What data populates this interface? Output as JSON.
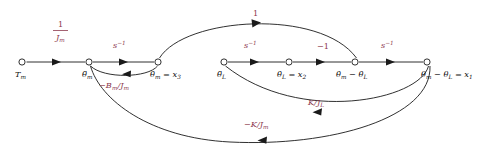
{
  "figure": {
    "kind": "signal-flow-graph",
    "background_color": "#ffffff",
    "edge_color": "#1a1a1a",
    "node_label_color": "#111111",
    "gain_label_color": "#8d3a4e"
  },
  "nodes": [
    {
      "id": "Tm",
      "label": "T",
      "sub": "m",
      "x": 22,
      "y": 62
    },
    {
      "id": "thm_ddot",
      "label": "θ̈",
      "sub": "m",
      "x": 89,
      "y": 62
    },
    {
      "id": "thm_dot",
      "label": "θ̇",
      "sub": "m",
      "x": 158,
      "y": 62
    },
    {
      "id": "thL_ddot",
      "label": "θ̈",
      "sub": "L",
      "x": 224,
      "y": 62
    },
    {
      "id": "thL_dot",
      "label": "θ̇",
      "sub": "L",
      "x": 289,
      "y": 62
    },
    {
      "id": "diff_dot",
      "label": "θ̇",
      "sub": "m",
      "x": 355,
      "y": 62
    },
    {
      "id": "diff",
      "label": "θ",
      "sub": "m",
      "x": 427,
      "y": 62
    }
  ],
  "node_labels": {
    "Tm": {
      "base": "T",
      "sub": "m",
      "tail": ""
    },
    "thm_ddot": {
      "base": "θ̈",
      "sub": "m",
      "tail": ""
    },
    "thm_dot": {
      "base": "θ̇",
      "sub": "m",
      "tail": " = x",
      "tail_sub": "3"
    },
    "thL_ddot": {
      "base": "θ̈",
      "sub": "L",
      "tail": ""
    },
    "thL_dot": {
      "base": "θ̇",
      "sub": "L",
      "tail": " = x",
      "tail_sub": "2"
    },
    "diff_dot": {
      "base": "θ̇",
      "sub": "m",
      "tail": " − θ̇",
      "tail_sub": "L"
    },
    "diff": {
      "base": "θ",
      "sub": "m",
      "tail": " − θ",
      "tail_sub": "L",
      "tail2": " = x",
      "tail2_sub": "1"
    }
  },
  "gains": {
    "one_over_Jm": {
      "numerator": "1",
      "denominator": "J",
      "denominator_sub": "m",
      "x": 62,
      "y": 30
    },
    "s_inv_1": {
      "base": "s",
      "sup": "−1",
      "x": 118,
      "y": 46
    },
    "s_inv_2": {
      "base": "s",
      "sup": "−1",
      "x": 249,
      "y": 46
    },
    "s_inv_3": {
      "base": "s",
      "sup": "−1",
      "x": 386,
      "y": 46
    },
    "unity": {
      "text": "1",
      "x": 256,
      "y": 15
    },
    "minus_one": {
      "text": "−1",
      "x": 323,
      "y": 47
    },
    "minus_Bm_Jm": {
      "text": "−B",
      "sub": "m",
      "mid": "/J",
      "sub2": "m",
      "x": 113,
      "y": 85
    },
    "K_over_JL": {
      "text": "K/J",
      "sub": "L",
      "x": 318,
      "y": 103
    },
    "minus_K_Jm": {
      "text": "−K/J",
      "sub": "m",
      "x": 256,
      "y": 125
    }
  },
  "edges": [
    {
      "id": "Tm-to-thmddot",
      "from": "Tm",
      "to": "thm_ddot",
      "gain": "one_over_Jm",
      "shape": "straight"
    },
    {
      "id": "thmddot-to-thmdot",
      "from": "thm_ddot",
      "to": "thm_dot",
      "gain": "s_inv_1",
      "shape": "straight"
    },
    {
      "id": "thLddot-to-thLdot",
      "from": "thL_ddot",
      "to": "thL_dot",
      "gain": "s_inv_2",
      "shape": "straight"
    },
    {
      "id": "thLdot-to-diffdot",
      "from": "thL_dot",
      "to": "diff_dot",
      "gain": "minus_one",
      "shape": "straight"
    },
    {
      "id": "diffdot-to-diff",
      "from": "diff_dot",
      "to": "diff",
      "gain": "s_inv_3",
      "shape": "straight"
    },
    {
      "id": "thmdot-to-diffdot",
      "from": "thm_dot",
      "to": "diff_dot",
      "gain": "unity",
      "shape": "arc-above"
    },
    {
      "id": "thmdot-to-thmddot",
      "from": "thm_dot",
      "to": "thm_ddot",
      "gain": "minus_Bm_Jm",
      "shape": "arc-below-small"
    },
    {
      "id": "diff-to-thLddot",
      "from": "diff",
      "to": "thL_ddot",
      "gain": "K_over_JL",
      "shape": "arc-below-mid"
    },
    {
      "id": "diff-to-thmddot",
      "from": "diff",
      "to": "thm_ddot",
      "gain": "minus_K_Jm",
      "shape": "arc-below-large"
    }
  ]
}
